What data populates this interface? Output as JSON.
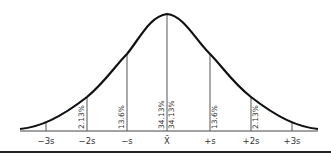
{
  "diagram": {
    "type": "normal-distribution-curve",
    "axis_labels": [
      "−3s",
      "−2s",
      "−s",
      "X̄",
      "+s",
      "+2s",
      "+3s"
    ],
    "region_percentages": {
      "left_2s_3s": "2.13%",
      "left_1s_2s": "13.6%",
      "left_0_1s": "34.13%",
      "right_0_1s": "34.13%",
      "right_1s_2s": "13.6%",
      "right_2s_3s": "2.13%"
    },
    "colors": {
      "curve": "#111111",
      "lines": "#555555",
      "text": "#333333"
    }
  }
}
